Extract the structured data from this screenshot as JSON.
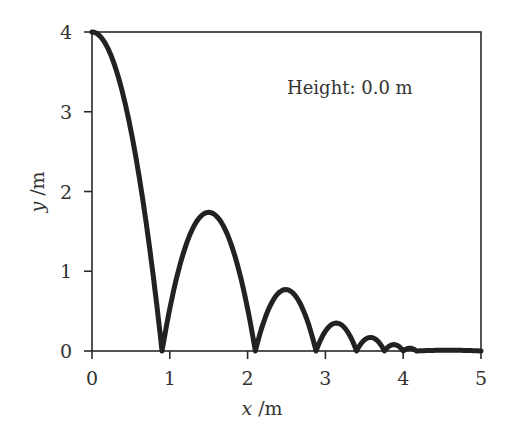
{
  "chart_data": {
    "type": "line",
    "title": "",
    "xlabel": "x /m",
    "ylabel": "y /m",
    "xlim": [
      0,
      5
    ],
    "ylim": [
      0,
      4
    ],
    "xticks": [
      0,
      1,
      2,
      3,
      4,
      5
    ],
    "yticks": [
      0,
      1,
      2,
      3,
      4
    ],
    "grid": false,
    "legend": null,
    "annotations": [
      {
        "text": "Height: 0.0 m",
        "x": 2.5,
        "y": 3.3
      }
    ],
    "series": [
      {
        "name": "bouncing ball trajectory",
        "color": "#222222",
        "bounces": [
          {
            "x_start": 0.0,
            "x_land": 0.9,
            "peak_x": 0.0,
            "peak_y": 4.0
          },
          {
            "x_start": 0.9,
            "x_land": 2.1,
            "peak_x": 1.5,
            "peak_y": 1.74
          },
          {
            "x_start": 2.1,
            "x_land": 2.88,
            "peak_x": 2.5,
            "peak_y": 0.77
          },
          {
            "x_start": 2.88,
            "x_land": 3.4,
            "peak_x": 3.14,
            "peak_y": 0.35
          },
          {
            "x_start": 3.4,
            "x_land": 3.76,
            "peak_x": 3.58,
            "peak_y": 0.17
          },
          {
            "x_start": 3.76,
            "x_land": 4.0,
            "peak_x": 3.88,
            "peak_y": 0.08
          },
          {
            "x_start": 4.0,
            "x_land": 4.17,
            "peak_x": 4.08,
            "peak_y": 0.035
          },
          {
            "x_start": 4.17,
            "x_land": 5.0,
            "peak_x": 4.5,
            "peak_y": 0.01
          }
        ]
      }
    ]
  },
  "labels": {
    "xlabel_var": "x",
    "xlabel_unit": " /m",
    "ylabel_var": "y",
    "ylabel_unit": " /m",
    "annotation": "Height: 0.0 m",
    "xticks": [
      "0",
      "1",
      "2",
      "3",
      "4",
      "5"
    ],
    "yticks": [
      "0",
      "1",
      "2",
      "3",
      "4"
    ]
  }
}
